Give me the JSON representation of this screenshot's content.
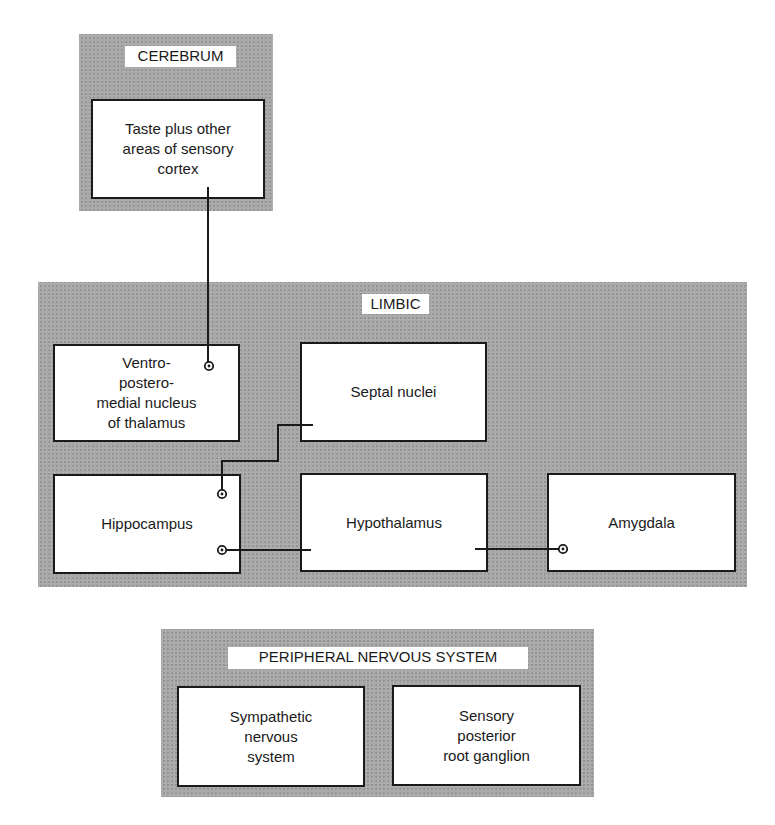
{
  "diagram": {
    "panels": {
      "cerebrum": {
        "label": "CEREBRUM"
      },
      "limbic": {
        "label": "LIMBIC"
      },
      "peripheral": {
        "label": "PERIPHERAL NERVOUS SYSTEM"
      }
    },
    "nodes": {
      "taste_cortex": "Taste plus other\nareas of sensory\ncortex",
      "vpm_thalamus": "Ventro-\npostero-\nmedial nucleus\nof thalamus",
      "septal_nuclei": "Septal nuclei",
      "hippocampus": "Hippocampus",
      "hypothalamus": "Hypothalamus",
      "amygdala": "Amygdala",
      "sympathetic": "Sympathetic\nnervous\nsystem",
      "sensory_ganglion": "Sensory\nposterior\nroot ganglion"
    },
    "connections": [
      {
        "from": "taste_cortex",
        "to": "vpm_thalamus"
      },
      {
        "from": "septal_nuclei",
        "to": "hippocampus"
      },
      {
        "from": "hypothalamus",
        "to": "hippocampus"
      },
      {
        "from": "hypothalamus",
        "to": "amygdala"
      }
    ],
    "colors": {
      "panel_fill": "#a9a9a9",
      "box_fill": "#ffffff",
      "line": "#1a1a1a"
    }
  }
}
